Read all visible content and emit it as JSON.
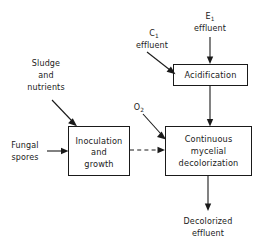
{
  "diagram": {
    "type": "process-flow-diagram",
    "background_color": "#ffffff",
    "line_color": "#1a1a1a",
    "nodes": [
      {
        "id": "acidification",
        "label": "Acidification",
        "lines": [
          "Acidification"
        ],
        "shape": "rectangle",
        "x": 173,
        "y": 64,
        "width": 75,
        "height": 22
      },
      {
        "id": "inoculation",
        "label": "Inoculation and growth",
        "lines": [
          "Inoculation",
          "and",
          "growth"
        ],
        "shape": "rectangle",
        "x": 68,
        "y": 126,
        "width": 62,
        "height": 50
      },
      {
        "id": "decolorization",
        "label": "Continuous mycelial decolorization",
        "lines": [
          "Continuous",
          "mycelial",
          "decolorization"
        ],
        "shape": "rectangle",
        "x": 165,
        "y": 126,
        "width": 87,
        "height": 50
      }
    ],
    "stream_labels": [
      {
        "id": "e1-effluent",
        "lines": [
          "E",
          "effluent"
        ],
        "subscript": "1",
        "text": "E₁ effluent",
        "x": 210,
        "y": 20
      },
      {
        "id": "c1-effluent",
        "lines": [
          "C",
          "effluent"
        ],
        "subscript": "1",
        "text": "C₁ effluent",
        "x": 153,
        "y": 40
      },
      {
        "id": "sludge-and-nutrients",
        "lines": [
          "Sludge",
          "and",
          "nutrients"
        ],
        "text": "Sludge and nutrients",
        "x": 44,
        "y": 72
      },
      {
        "id": "fungal-spores",
        "lines": [
          "Fungal",
          "spores"
        ],
        "text": "Fungal spores",
        "x": 26,
        "y": 151
      },
      {
        "id": "oxygen",
        "lines": [
          "O"
        ],
        "subscript": "2",
        "text": "O₂",
        "x": 140,
        "y": 107
      },
      {
        "id": "decolorized-effluent",
        "lines": [
          "Decolorized",
          "effluent"
        ],
        "text": "Decolorized effluent",
        "x": 208,
        "y": 226
      }
    ],
    "edges": [
      {
        "id": "e1-to-acidification",
        "from": "e1-effluent",
        "to": "acidification",
        "style": "solid",
        "arrow": true
      },
      {
        "id": "c1-to-acidification",
        "from": "c1-effluent",
        "to": "acidification",
        "style": "solid",
        "arrow": true
      },
      {
        "id": "acidification-to-decolorization",
        "from": "acidification",
        "to": "decolorization",
        "style": "solid",
        "arrow": true
      },
      {
        "id": "sludge-to-inoculation",
        "from": "sludge-and-nutrients",
        "to": "inoculation",
        "style": "solid",
        "arrow": true
      },
      {
        "id": "spores-to-inoculation",
        "from": "fungal-spores",
        "to": "inoculation",
        "style": "solid",
        "arrow": true
      },
      {
        "id": "oxygen-to-decolorization",
        "from": "oxygen",
        "to": "decolorization",
        "style": "solid",
        "arrow": true
      },
      {
        "id": "inoculation-to-decolorization",
        "from": "inoculation",
        "to": "decolorization",
        "style": "dashed",
        "arrow": true
      },
      {
        "id": "decolorization-to-effluent",
        "from": "decolorization",
        "to": "decolorized-effluent",
        "style": "solid",
        "arrow": true
      }
    ]
  }
}
